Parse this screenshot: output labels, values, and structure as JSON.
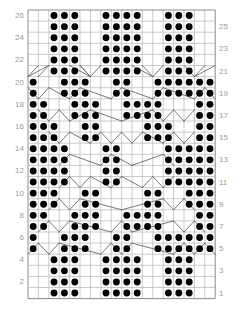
{
  "chart_data": {
    "type": "heatmap",
    "title": "",
    "xlabel": "",
    "ylabel": "",
    "columns": 18,
    "rows": 26,
    "grid": true,
    "legend_position": "none",
    "axis_note": "Row numbers shown at left (even rows 2-26) and right (odd rows 1-25); stitch columns unlabeled.",
    "symbols": {
      "dot": "purl stitch (filled black circle)",
      "blank": "knit stitch (empty cell)",
      "diagonal": "cable / twist crossing line"
    },
    "colors": {
      "dot": "#000000",
      "grid_line": "#b4b4b4",
      "grid_border": "#8c8c8c",
      "cable_line": "#555555",
      "row_label": "#9a9a9a",
      "background": "#ffffff"
    },
    "row_labels_left": [
      "26",
      "24",
      "22",
      "20",
      "18",
      "16",
      "14",
      "12",
      "10",
      "8",
      "6",
      "4",
      "2"
    ],
    "row_labels_right": [
      "25",
      "23",
      "21",
      "19",
      "17",
      "15",
      "13",
      "11",
      "9",
      "7",
      "5",
      "3",
      "1"
    ],
    "dot_map": [
      {
        "row": 26,
        "cols": [
          2,
          3,
          4,
          7,
          8,
          9,
          10,
          13,
          14,
          15
        ]
      },
      {
        "row": 25,
        "cols": [
          2,
          3,
          4,
          7,
          8,
          9,
          10,
          13,
          14,
          15
        ]
      },
      {
        "row": 24,
        "cols": [
          2,
          3,
          4,
          7,
          8,
          9,
          10,
          13,
          14,
          15
        ]
      },
      {
        "row": 23,
        "cols": [
          2,
          3,
          4,
          7,
          8,
          9,
          10,
          13,
          14,
          15
        ]
      },
      {
        "row": 22,
        "cols": [
          2,
          3,
          4,
          7,
          8,
          9,
          10,
          13,
          14,
          15
        ]
      },
      {
        "row": 21,
        "cols": [
          2,
          3,
          4,
          7,
          8,
          9,
          10,
          13,
          14,
          15
        ]
      },
      {
        "row": 20,
        "cols": [
          0,
          3,
          4,
          5,
          8,
          9,
          12,
          13,
          14,
          15,
          16,
          17
        ]
      },
      {
        "row": 19,
        "cols": [
          0,
          3,
          4,
          5,
          8,
          9,
          12,
          13,
          14,
          15,
          16,
          17
        ]
      },
      {
        "row": 18,
        "cols": [
          0,
          1,
          4,
          5,
          6,
          9,
          10,
          11,
          12,
          16,
          17
        ]
      },
      {
        "row": 17,
        "cols": [
          0,
          1,
          4,
          5,
          6,
          9,
          10,
          11,
          12,
          16,
          17
        ]
      },
      {
        "row": 16,
        "cols": [
          0,
          1,
          2,
          5,
          6,
          11,
          12,
          13,
          16,
          17
        ]
      },
      {
        "row": 15,
        "cols": [
          0,
          1,
          2,
          5,
          6,
          11,
          12,
          13,
          16,
          17
        ]
      },
      {
        "row": 14,
        "cols": [
          0,
          1,
          2,
          3,
          7,
          8,
          13,
          14,
          15,
          16,
          17
        ]
      },
      {
        "row": 13,
        "cols": [
          0,
          1,
          2,
          3,
          7,
          8,
          13,
          14,
          15,
          16,
          17
        ]
      },
      {
        "row": 12,
        "cols": [
          0,
          1,
          2,
          3,
          7,
          8,
          13,
          14,
          15,
          16,
          17
        ]
      },
      {
        "row": 11,
        "cols": [
          0,
          1,
          2,
          3,
          7,
          8,
          13,
          14,
          15,
          16,
          17
        ]
      },
      {
        "row": 10,
        "cols": [
          0,
          1,
          2,
          5,
          6,
          11,
          12,
          15,
          16,
          17
        ]
      },
      {
        "row": 9,
        "cols": [
          0,
          1,
          2,
          5,
          6,
          11,
          12,
          15,
          16,
          17
        ]
      },
      {
        "row": 8,
        "cols": [
          0,
          1,
          4,
          5,
          6,
          9,
          10,
          11,
          12,
          16,
          17
        ]
      },
      {
        "row": 7,
        "cols": [
          0,
          1,
          4,
          5,
          6,
          9,
          10,
          11,
          12,
          16,
          17
        ]
      },
      {
        "row": 6,
        "cols": [
          0,
          3,
          4,
          5,
          8,
          9,
          12,
          13,
          14,
          15,
          16,
          17
        ]
      },
      {
        "row": 5,
        "cols": [
          0,
          3,
          4,
          5,
          8,
          9,
          12,
          13,
          14,
          15,
          16,
          17
        ]
      },
      {
        "row": 4,
        "cols": [
          2,
          3,
          4,
          7,
          8,
          9,
          10,
          13,
          14,
          15
        ]
      },
      {
        "row": 3,
        "cols": [
          2,
          3,
          4,
          7,
          8,
          9,
          10,
          13,
          14,
          15
        ]
      },
      {
        "row": 2,
        "cols": [
          2,
          3,
          4,
          7,
          8,
          9,
          10,
          13,
          14,
          15
        ]
      },
      {
        "row": 1,
        "cols": [
          2,
          3,
          4,
          7,
          8,
          9,
          10,
          13,
          14,
          15
        ]
      }
    ],
    "cable_rows": [
      21,
      19,
      17,
      15,
      13,
      11,
      9,
      7,
      5
    ],
    "cable_segments": [
      {
        "row": 21,
        "paths": [
          [
            0,
            1.0,
            1,
            0.0
          ],
          [
            0,
            1.0,
            2,
            0.0
          ],
          [
            1,
            1.0,
            2,
            0.0
          ],
          [
            4,
            0.0,
            6,
            1.0
          ],
          [
            5,
            0.0,
            6,
            1.0
          ],
          [
            6,
            1.0,
            7,
            0.0
          ],
          [
            6,
            1.0,
            5,
            0.0
          ],
          [
            10,
            0.0,
            12,
            1.0
          ],
          [
            11,
            0.0,
            12,
            1.0
          ],
          [
            12,
            1.0,
            13,
            0.0
          ],
          [
            15,
            0.0,
            16,
            1.0
          ],
          [
            16,
            1.0,
            17,
            0.0
          ],
          [
            16,
            1.0,
            18,
            0.0
          ]
        ]
      },
      {
        "row": 19,
        "paths": [
          [
            0,
            0.0,
            1,
            1.0
          ],
          [
            1,
            1.0,
            2,
            0.0
          ],
          [
            2,
            0.0,
            4,
            1.0
          ],
          [
            4,
            1.0,
            5,
            0.0
          ],
          [
            5,
            0.0,
            8,
            1.0
          ],
          [
            8,
            1.0,
            9,
            0.0
          ],
          [
            9,
            0.0,
            12,
            1.0
          ],
          [
            12,
            1.0,
            13,
            0.0
          ],
          [
            13,
            0.0,
            16,
            1.0
          ],
          [
            16,
            1.0,
            17,
            0.0
          ],
          [
            17,
            0.0,
            18,
            1.0
          ]
        ]
      },
      {
        "row": 17,
        "paths": [
          [
            1,
            0.0,
            2,
            1.0
          ],
          [
            2,
            1.0,
            3,
            0.0
          ],
          [
            3,
            0.0,
            4,
            1.0
          ],
          [
            4,
            1.0,
            6,
            0.0
          ],
          [
            6,
            0.0,
            9,
            1.0
          ],
          [
            9,
            1.0,
            12,
            0.0
          ],
          [
            12,
            0.0,
            13,
            1.0
          ],
          [
            13,
            1.0,
            14,
            0.0
          ],
          [
            14,
            0.0,
            15,
            1.0
          ],
          [
            15,
            1.0,
            16,
            0.0
          ]
        ]
      },
      {
        "row": 15,
        "paths": [
          [
            2,
            0.0,
            3,
            1.0
          ],
          [
            3,
            1.0,
            4,
            0.0
          ],
          [
            4,
            0.0,
            6,
            1.0
          ],
          [
            6,
            1.0,
            7,
            0.0
          ],
          [
            7,
            0.0,
            8,
            1.0
          ],
          [
            8,
            1.0,
            9,
            0.0
          ],
          [
            9,
            0.0,
            10,
            1.0
          ],
          [
            10,
            1.0,
            11,
            0.0
          ],
          [
            11,
            0.0,
            13,
            1.0
          ],
          [
            13,
            1.0,
            14,
            0.0
          ],
          [
            14,
            0.0,
            15,
            1.0
          ],
          [
            15,
            1.0,
            16,
            0.0
          ]
        ]
      },
      {
        "row": 13,
        "paths": [
          [
            3,
            1.0,
            4,
            0.0
          ],
          [
            4,
            0.0,
            7,
            1.0
          ],
          [
            7,
            1.0,
            8,
            0.0
          ],
          [
            8,
            0.0,
            10,
            1.0
          ],
          [
            10,
            1.0,
            13,
            0.0
          ],
          [
            13,
            0.0,
            14,
            1.0
          ]
        ]
      },
      {
        "row": 11,
        "paths": [
          [
            3,
            1.0,
            4,
            0.0
          ],
          [
            4,
            0.0,
            5,
            1.0
          ],
          [
            5,
            1.0,
            6,
            0.0
          ],
          [
            6,
            0.0,
            8,
            1.0
          ],
          [
            8,
            1.0,
            9,
            0.0
          ],
          [
            9,
            0.0,
            11,
            1.0
          ],
          [
            11,
            1.0,
            12,
            0.0
          ],
          [
            12,
            0.0,
            13,
            1.0
          ],
          [
            13,
            1.0,
            14,
            0.0
          ]
        ]
      },
      {
        "row": 9,
        "paths": [
          [
            2,
            1.0,
            3,
            0.0
          ],
          [
            3,
            0.0,
            4,
            1.0
          ],
          [
            4,
            1.0,
            5,
            0.0
          ],
          [
            5,
            0.0,
            9,
            1.0
          ],
          [
            9,
            1.0,
            13,
            0.0
          ],
          [
            13,
            0.0,
            14,
            1.0
          ],
          [
            14,
            1.0,
            15,
            0.0
          ],
          [
            15,
            0.0,
            16,
            1.0
          ]
        ]
      },
      {
        "row": 7,
        "paths": [
          [
            1,
            1.0,
            2,
            0.0
          ],
          [
            2,
            0.0,
            3,
            1.0
          ],
          [
            3,
            1.0,
            4,
            0.0
          ],
          [
            4,
            0.0,
            8,
            1.0
          ],
          [
            8,
            1.0,
            9,
            0.0
          ],
          [
            9,
            0.0,
            10,
            1.0
          ],
          [
            10,
            1.0,
            14,
            0.0
          ],
          [
            14,
            0.0,
            15,
            1.0
          ],
          [
            15,
            1.0,
            16,
            0.0
          ],
          [
            16,
            0.0,
            17,
            1.0
          ]
        ]
      },
      {
        "row": 5,
        "paths": [
          [
            0,
            1.0,
            1,
            0.0
          ],
          [
            1,
            0.0,
            2,
            1.0
          ],
          [
            2,
            1.0,
            3,
            0.0
          ],
          [
            3,
            0.0,
            7,
            1.0
          ],
          [
            7,
            1.0,
            8,
            0.0
          ],
          [
            8,
            0.0,
            9,
            1.0
          ],
          [
            9,
            1.0,
            10,
            0.0
          ],
          [
            10,
            0.0,
            14,
            1.0
          ],
          [
            14,
            1.0,
            15,
            0.0
          ],
          [
            15,
            0.0,
            16,
            1.0
          ],
          [
            16,
            1.0,
            17,
            0.0
          ],
          [
            17,
            0.0,
            18,
            1.0
          ]
        ]
      }
    ]
  },
  "geometry": {
    "grid_left": 28,
    "grid_top": 10,
    "cell_w": 10.4,
    "cell_h": 11.1
  }
}
